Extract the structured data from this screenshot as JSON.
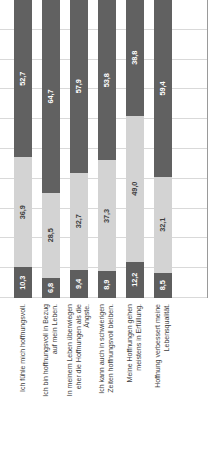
{
  "chart_data": {
    "type": "bar",
    "subtype": "stacked-horizontal",
    "title": "",
    "subtitle": "",
    "xlabel": "",
    "ylabel": "",
    "xlim": [
      0,
      100
    ],
    "grid": true,
    "gridlines": [
      0,
      10,
      20,
      30,
      40,
      50,
      60,
      70,
      80,
      90,
      100
    ],
    "legend_position": "none",
    "orientation": "rotated-90-ccw",
    "decimal_separator": ",",
    "categories": [
      "Ich fühle mich hoffnungsvoll.",
      "Ich bin hoffnungsvoll in Bezug auf mein Leben.",
      "In meinem Leben überwiegen eher die Hoffnungen als die Ängste.",
      "Ich kann auch in schwierigen Zeiten hoffnungsvoll bleiben.",
      "Meine Hoffnungen gehen meistens in Erfüllung.",
      "Hoffnung verbessert meine Lebensqualität."
    ],
    "category_lines": [
      [
        "Ich fühle mich hoffnungsvoll."
      ],
      [
        "Ich bin hoffnungsvoll in Bezug",
        "auf mein Leben."
      ],
      [
        "In meinem Leben überwiegen",
        "eher die Hoffnungen als die",
        "Ängste."
      ],
      [
        "Ich kann auch in schwierigen",
        "Zeiten hoffnungsvoll  bleiben."
      ],
      [
        "Meine Hoffnungen gehen",
        "meistens in Erfüllung."
      ],
      [
        "Hoffnung verbessert meine",
        "Lebensqualität."
      ]
    ],
    "series": [
      {
        "name": "Segment 1",
        "color": "#5e5e5e",
        "values": [
          10.3,
          6.8,
          9.4,
          8.9,
          12.2,
          8.5
        ],
        "labels": [
          "10,3",
          "6,8",
          "9,4",
          "8,9",
          "12,2",
          "8,5"
        ]
      },
      {
        "name": "Segment 2",
        "color": "#d3d3d3",
        "values": [
          36.9,
          28.5,
          32.7,
          37.3,
          49.0,
          32.1
        ],
        "labels": [
          "36,9",
          "28,5",
          "32,7",
          "37,3",
          "49,0",
          "32,1"
        ]
      },
      {
        "name": "Segment 3",
        "color": "#616161",
        "values": [
          52.7,
          64.7,
          57.9,
          53.8,
          38.8,
          59.4
        ],
        "labels": [
          "52,7",
          "64,7",
          "57,9",
          "53,8",
          "38,8",
          "59,4"
        ]
      }
    ]
  },
  "colors": {
    "segment_1": "#5e5e5e",
    "segment_2": "#d3d3d3",
    "segment_3": "#616161",
    "gridline": "#d9d9d9",
    "axis": "#9a9a9a",
    "background": "#ffffff",
    "label_text": "#3f3f3f"
  }
}
